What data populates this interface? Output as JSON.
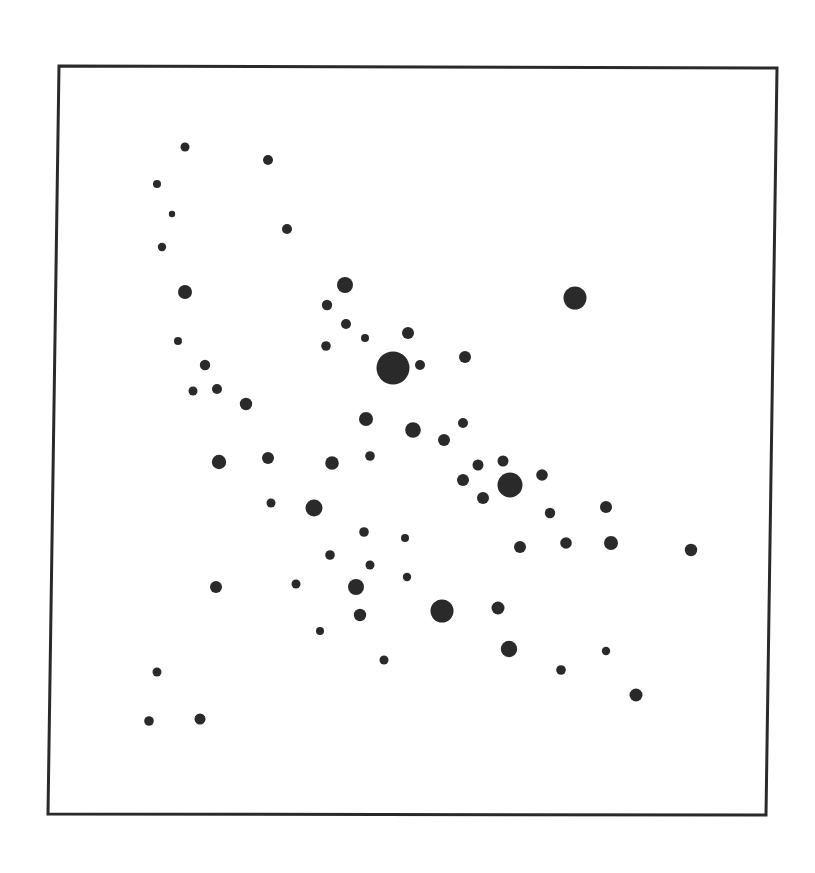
{
  "chart_data": {
    "type": "scatter",
    "title": "",
    "xlabel": "",
    "ylabel": "",
    "grid": false,
    "legend": null,
    "frame": {
      "top_left": [
        59,
        66
      ],
      "top_right": [
        777,
        68
      ],
      "bottom_right": [
        766,
        815
      ],
      "bottom_left": [
        48,
        814
      ],
      "stroke": "#2a2a2a",
      "stroke_width": 3
    },
    "dot_color": "#2a2a2a",
    "points": [
      {
        "x": 185,
        "y": 147,
        "r": 4.5
      },
      {
        "x": 268,
        "y": 160,
        "r": 5
      },
      {
        "x": 157,
        "y": 184,
        "r": 4
      },
      {
        "x": 172,
        "y": 214,
        "r": 3.2
      },
      {
        "x": 287,
        "y": 229,
        "r": 5
      },
      {
        "x": 162,
        "y": 247,
        "r": 4.2
      },
      {
        "x": 185,
        "y": 292,
        "r": 7
      },
      {
        "x": 345,
        "y": 285,
        "r": 8
      },
      {
        "x": 575,
        "y": 298,
        "r": 11.5
      },
      {
        "x": 327,
        "y": 305,
        "r": 5.2
      },
      {
        "x": 178,
        "y": 341,
        "r": 4
      },
      {
        "x": 346,
        "y": 324,
        "r": 5
      },
      {
        "x": 365,
        "y": 338,
        "r": 4
      },
      {
        "x": 408,
        "y": 333,
        "r": 6
      },
      {
        "x": 326,
        "y": 346,
        "r": 4.8
      },
      {
        "x": 393,
        "y": 368,
        "r": 16.5
      },
      {
        "x": 420,
        "y": 365,
        "r": 5
      },
      {
        "x": 465,
        "y": 357,
        "r": 6
      },
      {
        "x": 205,
        "y": 365,
        "r": 5.2
      },
      {
        "x": 193,
        "y": 391,
        "r": 4.5
      },
      {
        "x": 217,
        "y": 389,
        "r": 5
      },
      {
        "x": 246,
        "y": 404,
        "r": 6.2
      },
      {
        "x": 366,
        "y": 419,
        "r": 7
      },
      {
        "x": 413,
        "y": 430,
        "r": 7.8
      },
      {
        "x": 463,
        "y": 423,
        "r": 5
      },
      {
        "x": 444,
        "y": 440,
        "r": 6
      },
      {
        "x": 219,
        "y": 462,
        "r": 7.2
      },
      {
        "x": 268,
        "y": 458,
        "r": 6
      },
      {
        "x": 332,
        "y": 463,
        "r": 6.8
      },
      {
        "x": 370,
        "y": 456,
        "r": 4.8
      },
      {
        "x": 478,
        "y": 465,
        "r": 5.5
      },
      {
        "x": 503,
        "y": 461,
        "r": 5.5
      },
      {
        "x": 463,
        "y": 480,
        "r": 6
      },
      {
        "x": 510,
        "y": 485,
        "r": 12.5
      },
      {
        "x": 542,
        "y": 475,
        "r": 5.8
      },
      {
        "x": 483,
        "y": 498,
        "r": 6
      },
      {
        "x": 271,
        "y": 503,
        "r": 4.5
      },
      {
        "x": 314,
        "y": 508,
        "r": 8.5
      },
      {
        "x": 550,
        "y": 513,
        "r": 5.2
      },
      {
        "x": 606,
        "y": 507,
        "r": 6
      },
      {
        "x": 364,
        "y": 532,
        "r": 4.8
      },
      {
        "x": 405,
        "y": 538,
        "r": 4
      },
      {
        "x": 520,
        "y": 547,
        "r": 6
      },
      {
        "x": 566,
        "y": 543,
        "r": 5.8
      },
      {
        "x": 611,
        "y": 543,
        "r": 7
      },
      {
        "x": 691,
        "y": 550,
        "r": 6.2
      },
      {
        "x": 330,
        "y": 555,
        "r": 4.8
      },
      {
        "x": 370,
        "y": 565,
        "r": 4.5
      },
      {
        "x": 407,
        "y": 577,
        "r": 4.2
      },
      {
        "x": 216,
        "y": 587,
        "r": 6
      },
      {
        "x": 296,
        "y": 584,
        "r": 4.5
      },
      {
        "x": 356,
        "y": 587,
        "r": 8
      },
      {
        "x": 360,
        "y": 615,
        "r": 6.2
      },
      {
        "x": 442,
        "y": 611,
        "r": 11.5
      },
      {
        "x": 498,
        "y": 608,
        "r": 6.5
      },
      {
        "x": 320,
        "y": 631,
        "r": 4
      },
      {
        "x": 509,
        "y": 649,
        "r": 8.2
      },
      {
        "x": 606,
        "y": 651,
        "r": 4.2
      },
      {
        "x": 384,
        "y": 660,
        "r": 4.5
      },
      {
        "x": 561,
        "y": 670,
        "r": 4.8
      },
      {
        "x": 157,
        "y": 672,
        "r": 4.5
      },
      {
        "x": 636,
        "y": 695,
        "r": 6.5
      },
      {
        "x": 149,
        "y": 721,
        "r": 4.8
      },
      {
        "x": 200,
        "y": 719,
        "r": 5.5
      }
    ]
  }
}
